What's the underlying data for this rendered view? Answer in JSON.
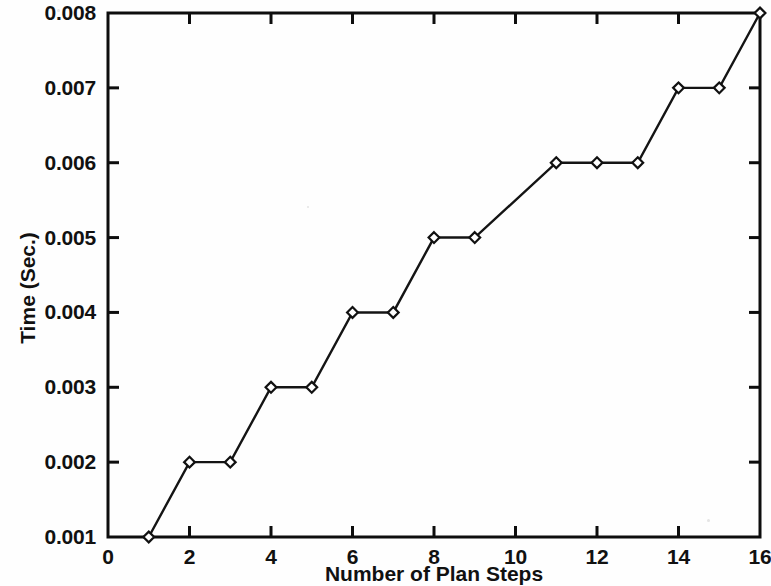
{
  "chart_data": {
    "type": "line",
    "title": "",
    "xlabel": "Number of Plan Steps",
    "ylabel": "Time (Sec.)",
    "xlim": [
      0,
      16
    ],
    "ylim": [
      0.001,
      0.008
    ],
    "grid": false,
    "legend": null,
    "marker": "diamond",
    "x": [
      1,
      2,
      3,
      4,
      5,
      6,
      7,
      8,
      9,
      11,
      12,
      13,
      14,
      15,
      16
    ],
    "values": [
      0.001,
      0.002,
      0.002,
      0.003,
      0.003,
      0.004,
      0.004,
      0.005,
      0.005,
      0.006,
      0.006,
      0.006,
      0.007,
      0.007,
      0.008
    ],
    "points": [
      {
        "x": 1,
        "y": 0.001
      },
      {
        "x": 2,
        "y": 0.002
      },
      {
        "x": 3,
        "y": 0.002
      },
      {
        "x": 4,
        "y": 0.003
      },
      {
        "x": 5,
        "y": 0.003
      },
      {
        "x": 6,
        "y": 0.004
      },
      {
        "x": 7,
        "y": 0.004
      },
      {
        "x": 8,
        "y": 0.005
      },
      {
        "x": 9,
        "y": 0.005
      },
      {
        "x": 11,
        "y": 0.006
      },
      {
        "x": 12,
        "y": 0.006
      },
      {
        "x": 13,
        "y": 0.006
      },
      {
        "x": 14,
        "y": 0.007
      },
      {
        "x": 15,
        "y": 0.007
      },
      {
        "x": 16,
        "y": 0.008
      }
    ],
    "xticks": [
      0,
      2,
      4,
      6,
      8,
      10,
      12,
      14,
      16
    ],
    "xtick_labels": [
      "0",
      "2",
      "4",
      "6",
      "8",
      "10",
      "12",
      "14",
      "16"
    ],
    "yticks": [
      0.001,
      0.002,
      0.003,
      0.004,
      0.005,
      0.006,
      0.007,
      0.008
    ],
    "ytick_labels": [
      "0.001",
      "0.002",
      "0.003",
      "0.004",
      "0.005",
      "0.006",
      "0.007",
      "0.008"
    ],
    "colors": {
      "line": "#141414",
      "axis": "#0d0d0d",
      "marker_fill": "#ffffff",
      "background": "#fefefe"
    }
  }
}
